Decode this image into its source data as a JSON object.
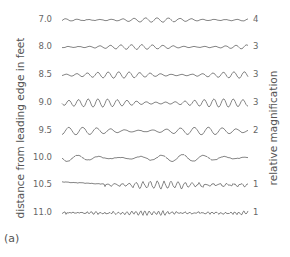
{
  "figure": {
    "panel_label": "(a)",
    "left_axis_label": "distance from leading edge in feet",
    "right_axis_label": "relative magnification",
    "trace_color": "#777777",
    "rows": [
      {
        "distance": "7.0",
        "magnification": "4",
        "y": 20
      },
      {
        "distance": "8.0",
        "magnification": "3",
        "y": 47
      },
      {
        "distance": "8.5",
        "magnification": "3",
        "y": 75
      },
      {
        "distance": "9.0",
        "magnification": "3",
        "y": 103
      },
      {
        "distance": "9.5",
        "magnification": "2",
        "y": 131
      },
      {
        "distance": "10.0",
        "magnification": "",
        "y": 158
      },
      {
        "distance": "10.5",
        "magnification": "1",
        "y": 185
      },
      {
        "distance": "11.0",
        "magnification": "1",
        "y": 213
      }
    ]
  }
}
